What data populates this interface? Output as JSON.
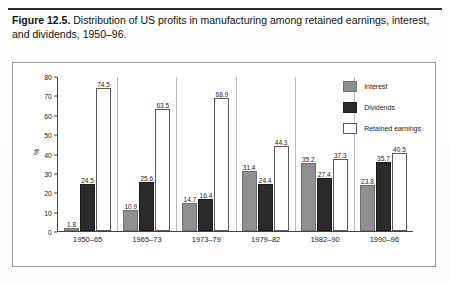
{
  "figure": {
    "label": "Figure 12.5.",
    "caption": "Distribution of US profits in manufacturing among retained earnings, interest, and dividends, 1950–96."
  },
  "colors": {
    "interest": "#8f8f8f",
    "dividends": "#2a2a2a",
    "retained": "#ffffff",
    "axis": "#444444",
    "frame": "#9a9a9a"
  },
  "legend": {
    "position": "top-right",
    "items": [
      {
        "label": "Interest",
        "key": "interest"
      },
      {
        "label": "Dividends",
        "key": "dividends"
      },
      {
        "label": "Retained earnings",
        "key": "retained"
      }
    ]
  },
  "axis": {
    "y_ticks": [
      "80",
      "70",
      "60",
      "50",
      "40",
      "30",
      "20",
      "10",
      "0"
    ],
    "y_label": "%"
  },
  "chart_data": {
    "type": "bar",
    "title": "Distribution of US profits in manufacturing among retained earnings, interest, and dividends, 1950–96",
    "xlabel": "",
    "ylabel": "%",
    "ylim": [
      0,
      80
    ],
    "ytick_step": 10,
    "grid": false,
    "legend_position": "top-right",
    "categories": [
      "1950–65",
      "1965–73",
      "1973–79",
      "1979–82",
      "1982–90",
      "1990–96"
    ],
    "series": [
      {
        "name": "Interest",
        "values": [
          1.8,
          10.9,
          14.7,
          31.4,
          35.2,
          23.8
        ]
      },
      {
        "name": "Dividends",
        "values": [
          24.5,
          25.6,
          16.4,
          24.4,
          27.4,
          35.7
        ]
      },
      {
        "name": "Retained earnings",
        "values": [
          74.5,
          63.5,
          68.9,
          44.3,
          37.3,
          40.5
        ]
      }
    ]
  }
}
